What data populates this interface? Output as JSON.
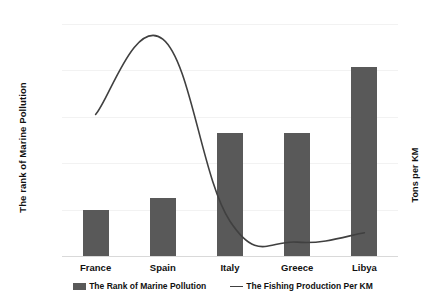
{
  "chart_data": {
    "type": "bar",
    "title": "",
    "categories": [
      "France",
      "Spain",
      "Italy",
      "Greece",
      "Libya"
    ],
    "series": [
      {
        "name": "The Rank of Marine Pollution",
        "type": "bar",
        "axis": "left",
        "color": "#595959",
        "values": [
          50,
          62,
          133,
          133,
          204
        ]
      },
      {
        "name": "The Fishing Production Per KM",
        "type": "line",
        "axis": "right",
        "color": "#404040",
        "smooth": true,
        "values": [
          122,
          187,
          30,
          12,
          20
        ]
      }
    ],
    "xlabel": "",
    "ylabel": "The rank of Marine Pollution",
    "y2label": "Tons per KM",
    "ylim": [
      0,
      250
    ],
    "y2lim": [
      0,
      200
    ],
    "yticks": [
      0,
      50,
      100,
      150,
      200,
      250
    ],
    "y2ticks": [
      0,
      20,
      40,
      60,
      80,
      100,
      120,
      140,
      160,
      180,
      200
    ],
    "grid": true,
    "legend_position": "bottom"
  },
  "axes": {
    "left_title": "The rank of Marine Pollution",
    "right_title": "Tons per KM",
    "left_ticks": [
      "0",
      "50",
      "100",
      "150",
      "200",
      "250"
    ],
    "right_ticks": [
      "0",
      "20",
      "40",
      "60",
      "80",
      "100",
      "120",
      "140",
      "160",
      "180",
      "200"
    ]
  },
  "categories": [
    "France",
    "Spain",
    "Italy",
    "Greece",
    "Libya"
  ],
  "legend": {
    "items": [
      {
        "label": "The Rank of Marine Pollution",
        "marker": "bar-swatch-icon"
      },
      {
        "label": "The Fishing Production Per KM",
        "marker": "line-swatch-icon"
      }
    ]
  }
}
